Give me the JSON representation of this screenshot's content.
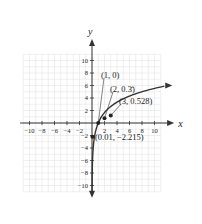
{
  "chart_data": {
    "type": "line",
    "title": "",
    "xlabel": "x",
    "ylabel": "y",
    "xlim": [
      -11,
      11
    ],
    "ylim": [
      -11,
      11
    ],
    "grid": true,
    "x_ticks": [
      -10,
      -8,
      -6,
      -4,
      -2,
      2,
      4,
      6,
      8,
      10
    ],
    "y_ticks": [
      -10,
      -8,
      -6,
      -4,
      -2,
      2,
      4,
      6,
      8,
      10
    ],
    "x_tick_labels": [
      "−10",
      "−8",
      "−6",
      "−4",
      "−2",
      "2",
      "4",
      "6",
      "8",
      "10"
    ],
    "y_tick_labels": [
      "−10",
      "−8",
      "−6",
      "−4",
      "−2",
      "2",
      "4",
      "6",
      "8",
      "10"
    ],
    "series": [
      {
        "name": "log curve",
        "description": "logarithmic curve with vertical asymptote x=0"
      }
    ],
    "points": [
      {
        "x": 1,
        "y": 0,
        "label": "(1, 0)"
      },
      {
        "x": 2,
        "y": 0.333,
        "label": "(2, 0.3̄)"
      },
      {
        "x": 3,
        "y": 0.528,
        "label": "(3, 0.528)"
      },
      {
        "x": 0.01,
        "y": -2.215,
        "label": "(0.01, −2.215)"
      }
    ]
  }
}
